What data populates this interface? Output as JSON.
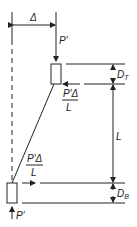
{
  "diagram": {
    "labels": {
      "delta": "Δ",
      "load_top": "P′",
      "load_bottom": "P′",
      "shear_top_num": "P′Δ",
      "shear_top_den": "L",
      "shear_bottom_num": "P′Δ",
      "shear_bottom_den": "L",
      "dim_top": "D",
      "dim_top_sub": "T",
      "dim_length": "L",
      "dim_bottom": "D",
      "dim_bottom_sub": "B"
    },
    "colors": {
      "line": "#222222",
      "background": "#ffffff"
    }
  }
}
